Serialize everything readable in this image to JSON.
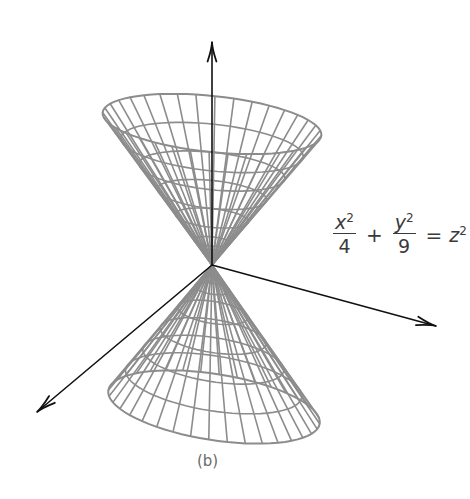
{
  "figure": {
    "caption": "(b)",
    "equation": {
      "term1": {
        "numerator_var": "x",
        "numerator_exp": "2",
        "denominator": "4"
      },
      "op1": "+",
      "term2": {
        "numerator_var": "y",
        "numerator_exp": "2",
        "denominator": "9"
      },
      "op2": "=",
      "rhs_var": "z",
      "rhs_exp": "2"
    },
    "surface": "elliptic double cone",
    "colors": {
      "mesh": "#8c8c8c",
      "axes": "#111111",
      "text": "#3a3a3a",
      "caption": "#6a6a6a"
    },
    "geometry": {
      "vertex": [
        212,
        265
      ],
      "upper_rim": {
        "cx": 212,
        "cy": 124,
        "rx": 110,
        "ry": 28,
        "rotate": 6
      },
      "lower_rim": {
        "cx": 214,
        "cy": 407,
        "rx": 107,
        "ry": 33,
        "rotate": 9
      },
      "meridians": 36,
      "rings": 6,
      "axes": {
        "z": {
          "from": [
            212,
            265
          ],
          "to": [
            212,
            42
          ]
        },
        "x": {
          "from": [
            212,
            265
          ],
          "to": [
            37,
            412
          ]
        },
        "y": {
          "from": [
            212,
            265
          ],
          "to": [
            436,
            326
          ]
        }
      }
    }
  }
}
